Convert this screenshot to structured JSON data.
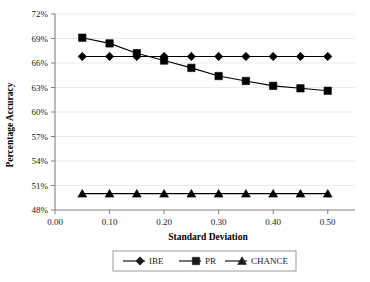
{
  "chart_data": {
    "type": "line",
    "title": "",
    "xlabel": "Standard Deviation",
    "ylabel": "Percentage Accuracy",
    "x": [
      0.05,
      0.1,
      0.15,
      0.2,
      0.25,
      0.3,
      0.35,
      0.4,
      0.45,
      0.5
    ],
    "xlim": [
      0.0,
      0.55
    ],
    "ylim": [
      48,
      72
    ],
    "grid": true,
    "legend_position": "bottom",
    "xticks": [
      "0.00",
      "0.10",
      "0.20",
      "0.30",
      "0.40",
      "0.50"
    ],
    "xtick_values": [
      0.0,
      0.1,
      0.2,
      0.3,
      0.4,
      0.5
    ],
    "yticks": [
      "48%",
      "51%",
      "54%",
      "57%",
      "60%",
      "63%",
      "66%",
      "69%",
      "72%"
    ],
    "ytick_values": [
      48,
      51,
      54,
      57,
      60,
      63,
      66,
      69,
      72
    ],
    "series": [
      {
        "name": "IBE",
        "marker": "diamond",
        "color": "#000000",
        "values": [
          66.8,
          66.8,
          66.8,
          66.8,
          66.8,
          66.8,
          66.8,
          66.8,
          66.8,
          66.8
        ]
      },
      {
        "name": "PR",
        "marker": "square",
        "color": "#000000",
        "values": [
          69.1,
          68.4,
          67.2,
          66.3,
          65.4,
          64.4,
          63.8,
          63.2,
          62.9,
          62.6
        ]
      },
      {
        "name": "CHANCE",
        "marker": "triangle",
        "color": "#000000",
        "values": [
          50.0,
          50.0,
          50.0,
          50.0,
          50.0,
          50.0,
          50.0,
          50.0,
          50.0,
          50.0
        ]
      }
    ]
  },
  "legend": {
    "items": [
      {
        "label": "IBE",
        "marker": "diamond"
      },
      {
        "label": "PR",
        "marker": "square"
      },
      {
        "label": "CHANCE",
        "marker": "triangle"
      }
    ]
  },
  "colors": {
    "line": "#1a1a1a",
    "grid": "#ebebeb",
    "axis": "#808080",
    "text": "#1a1a1a",
    "legend_border": "#999999"
  }
}
